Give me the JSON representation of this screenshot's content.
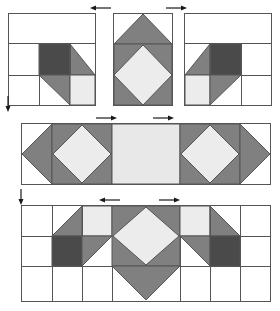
{
  "diagram": {
    "kind": "quilt-block-assembly",
    "palette": {
      "dark_gray": "#4a4a4a",
      "medium_gray": "#808080",
      "light_gray": "#ececec",
      "off_white": "#e8e8e8",
      "white": "#ffffff",
      "line": "#555555",
      "arrow": "#1a1a1a"
    },
    "stroke_width": "1",
    "rows": [
      {
        "name": "top-row",
        "label": "Corner and side units",
        "units": [
          {
            "name": "corner-unit-left",
            "label": "Corner unit, left",
            "x": 8,
            "y": 13,
            "w": 88,
            "h": 93
          },
          {
            "name": "side-unit-center",
            "label": "Square in a square side unit",
            "x": 113,
            "y": 13,
            "w": 60,
            "h": 93
          },
          {
            "name": "corner-unit-right",
            "label": "Corner unit, right",
            "x": 184,
            "y": 13,
            "w": 88,
            "h": 93
          }
        ]
      },
      {
        "name": "middle-row",
        "label": "Center row strip",
        "units": [
          {
            "name": "center-strip",
            "label": "Center strip with two square-in-square units",
            "x": 21,
            "y": 123,
            "w": 250,
            "h": 62
          }
        ]
      },
      {
        "name": "bottom-row",
        "label": "Assembled block",
        "units": [
          {
            "name": "assembled-block",
            "label": "Completed block",
            "x": 21,
            "y": 205,
            "w": 250,
            "h": 97
          }
        ]
      }
    ],
    "markers": [
      {
        "name": "seam-arrow-top-left",
        "direction": "left",
        "x": 90,
        "y": 4
      },
      {
        "name": "seam-arrow-top-right",
        "direction": "right",
        "x": 165,
        "y": 4
      },
      {
        "name": "seam-arrow-mid-left",
        "direction": "right",
        "x": 95,
        "y": 114
      },
      {
        "name": "seam-arrow-mid-right",
        "direction": "right",
        "x": 152,
        "y": 114
      },
      {
        "name": "seam-arrow-bottom-left",
        "direction": "left",
        "x": 99,
        "y": 196
      },
      {
        "name": "seam-arrow-bottom-right",
        "direction": "right",
        "x": 158,
        "y": 196
      },
      {
        "name": "seam-arrow-edge-upper",
        "direction": "down",
        "x": 5,
        "y": 97
      },
      {
        "name": "seam-arrow-edge-lower",
        "direction": "down",
        "x": 17,
        "y": 190
      }
    ]
  }
}
